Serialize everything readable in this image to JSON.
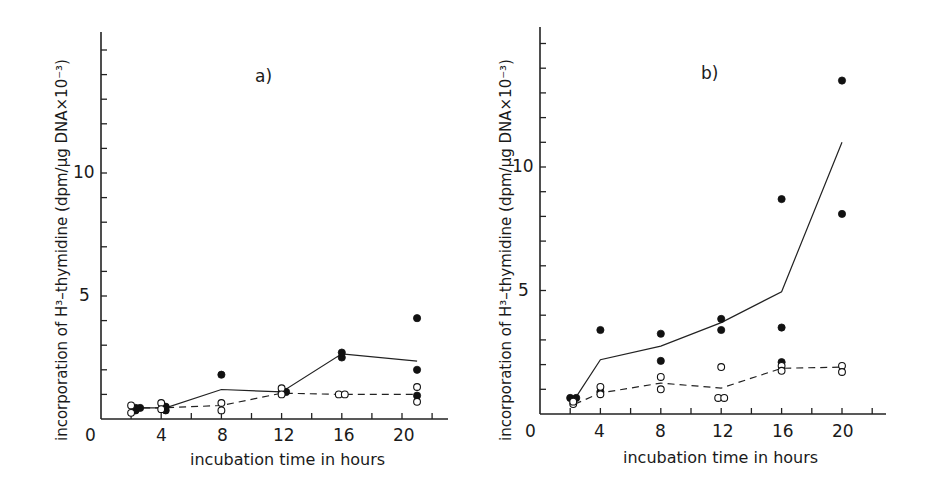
{
  "chart_data": [
    {
      "type": "scatter",
      "panel_label": "a)",
      "xlabel": "incubation time in hours",
      "ylabel": "incorporation of H³–thymidine (dpm/µg DNA×10⁻³)",
      "x_ticks": [
        4,
        8,
        12,
        16,
        20
      ],
      "x_origin_label": "0",
      "y_ticks": [
        5,
        10
      ],
      "xlim": [
        0,
        23
      ],
      "ylim": [
        0,
        15.5
      ],
      "grid": false,
      "series": [
        {
          "name": "filled circles",
          "marker": "filled",
          "points": [
            [
              2.3,
              0.35
            ],
            [
              2.3,
              0.45
            ],
            [
              2.6,
              0.45
            ],
            [
              4.3,
              0.35
            ],
            [
              4.3,
              0.5
            ],
            [
              4.1,
              0.45
            ],
            [
              8,
              1.8
            ],
            [
              12,
              1.1
            ],
            [
              12.3,
              1.1
            ],
            [
              16,
              2.5
            ],
            [
              16,
              2.7
            ],
            [
              21,
              4.1
            ],
            [
              21,
              2.0
            ],
            [
              21,
              0.95
            ]
          ]
        },
        {
          "name": "open circles",
          "marker": "open",
          "points": [
            [
              2,
              0.55
            ],
            [
              2,
              0.25
            ],
            [
              4,
              0.65
            ],
            [
              4,
              0.4
            ],
            [
              8,
              0.65
            ],
            [
              8,
              0.35
            ],
            [
              12,
              1.25
            ],
            [
              12,
              1.0
            ],
            [
              15.8,
              1.0
            ],
            [
              16.2,
              1.0
            ],
            [
              21,
              1.3
            ],
            [
              21,
              0.7
            ]
          ]
        },
        {
          "name": "filled mean",
          "line": "solid",
          "points": [
            [
              2.3,
              0.45
            ],
            [
              4.3,
              0.45
            ],
            [
              8,
              1.2
            ],
            [
              12,
              1.1
            ],
            [
              16,
              2.65
            ],
            [
              21,
              2.35
            ]
          ]
        },
        {
          "name": "open mean",
          "line": "dashed",
          "points": [
            [
              2,
              0.45
            ],
            [
              4,
              0.45
            ],
            [
              8,
              0.55
            ],
            [
              12,
              1.05
            ],
            [
              16,
              1.0
            ],
            [
              21,
              1.0
            ]
          ]
        }
      ]
    },
    {
      "type": "scatter",
      "panel_label": "b)",
      "xlabel": "incubation time in hours",
      "ylabel": "incorporation of H³–thymidine (dpm/µg DNA×10⁻³)",
      "x_ticks": [
        4,
        8,
        12,
        16,
        20
      ],
      "x_origin_label": "0",
      "y_ticks": [
        5,
        10
      ],
      "xlim": [
        0,
        23
      ],
      "ylim": [
        0,
        15.5
      ],
      "grid": false,
      "series": [
        {
          "name": "filled circles",
          "marker": "filled",
          "points": [
            [
              2,
              0.65
            ],
            [
              2.4,
              0.65
            ],
            [
              4,
              3.4
            ],
            [
              4,
              0.9
            ],
            [
              8,
              3.25
            ],
            [
              8,
              2.15
            ],
            [
              12,
              3.85
            ],
            [
              12,
              3.4
            ],
            [
              16,
              8.7
            ],
            [
              16,
              3.5
            ],
            [
              16,
              2.1
            ],
            [
              20,
              13.5
            ],
            [
              20,
              8.1
            ]
          ]
        },
        {
          "name": "open circles",
          "marker": "open",
          "points": [
            [
              2.2,
              0.4
            ],
            [
              2.2,
              0.5
            ],
            [
              4,
              1.1
            ],
            [
              4,
              0.8
            ],
            [
              8,
              1.5
            ],
            [
              8,
              1.0
            ],
            [
              12,
              1.9
            ],
            [
              11.8,
              0.65
            ],
            [
              12.2,
              0.65
            ],
            [
              16,
              1.95
            ],
            [
              16,
              1.75
            ],
            [
              20,
              1.95
            ],
            [
              20,
              1.7
            ]
          ]
        },
        {
          "name": "filled mean",
          "line": "solid",
          "points": [
            [
              2.3,
              0.6
            ],
            [
              4,
              2.2
            ],
            [
              8,
              2.75
            ],
            [
              12,
              3.7
            ],
            [
              16,
              4.95
            ],
            [
              20,
              11.0
            ]
          ]
        },
        {
          "name": "open mean",
          "line": "dashed",
          "points": [
            [
              2.3,
              0.4
            ],
            [
              4,
              0.85
            ],
            [
              8,
              1.25
            ],
            [
              12,
              1.05
            ],
            [
              16,
              1.85
            ],
            [
              20,
              1.9
            ]
          ]
        }
      ]
    }
  ],
  "panels": [
    {
      "label": "a)",
      "xlabel": "incubation time in hours",
      "ylabel": "incorporation of H³–thymidine (dpm/µg DNA×10⁻³)",
      "zero": "0",
      "xt": [
        "4",
        "8",
        "12",
        "16",
        "20"
      ],
      "yt": [
        "5",
        "10"
      ]
    },
    {
      "label": "b)",
      "xlabel": "incubation time in hours",
      "ylabel": "incorporation of H³–thymidine (dpm/µg DNA×10⁻³)",
      "zero": "0",
      "xt": [
        "4",
        "8",
        "12",
        "16",
        "20"
      ],
      "yt": [
        "5",
        "10"
      ]
    }
  ],
  "layout": [
    {
      "x0": 101,
      "y0": 419,
      "px_per_x": 15.05,
      "px_per_y": 24.6,
      "x_end": 448,
      "y_top": 32,
      "x_minor_max": 22,
      "y_minor_max": 15,
      "label_pos": [
        262,
        80
      ],
      "ylabel_x": 68,
      "xlabel_pos": [
        290,
        463
      ]
    },
    {
      "x0": 540,
      "y0": 414,
      "px_per_x": 15.1,
      "px_per_y": 24.7,
      "x_end": 886,
      "y_top": 27,
      "x_minor_max": 22,
      "y_minor_max": 15,
      "label_pos": [
        711,
        77
      ],
      "ylabel_x": 515,
      "xlabel_pos": [
        724,
        461
      ]
    }
  ]
}
